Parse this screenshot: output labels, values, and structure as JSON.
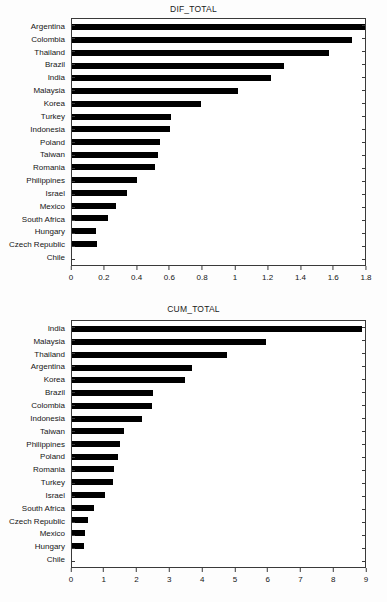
{
  "chart_data": [
    {
      "type": "bar",
      "orientation": "horizontal",
      "title": "DIF_TOTAL",
      "xlabel": "",
      "ylabel": "",
      "xlim": [
        0,
        1.8
      ],
      "grid": false,
      "legend": "none",
      "xticks": [
        "0",
        "0.2",
        "0.4",
        "0.6",
        "0.8",
        "1",
        "1.2",
        "1.4",
        "1.6",
        "1.8"
      ],
      "xtick_values": [
        0,
        0.2,
        0.4,
        0.6,
        0.8,
        1.0,
        1.2,
        1.4,
        1.6,
        1.8
      ],
      "categories": [
        "Argentina",
        "Colombia",
        "Thailand",
        "Brazil",
        "India",
        "Malaysia",
        "Korea",
        "Turkey",
        "Indonesia",
        "Poland",
        "Taiwan",
        "Romania",
        "Philippines",
        "Israel",
        "Mexico",
        "South Africa",
        "Hungary",
        "Czech Republic",
        "Chile"
      ],
      "values": [
        1.8,
        1.72,
        1.58,
        1.3,
        1.22,
        1.02,
        0.79,
        0.61,
        0.6,
        0.54,
        0.53,
        0.51,
        0.4,
        0.34,
        0.27,
        0.22,
        0.15,
        0.155,
        0.0
      ]
    },
    {
      "type": "bar",
      "orientation": "horizontal",
      "title": "CUM_TOTAL",
      "xlabel": "",
      "ylabel": "",
      "xlim": [
        0,
        9
      ],
      "grid": false,
      "legend": "none",
      "xticks": [
        "0",
        "1",
        "2",
        "3",
        "4",
        "5",
        "6",
        "7",
        "8",
        "9"
      ],
      "xtick_values": [
        0,
        1,
        2,
        3,
        4,
        5,
        6,
        7,
        8,
        9
      ],
      "categories": [
        "India",
        "Malaysia",
        "Thailand",
        "Argentina",
        "Korea",
        "Brazil",
        "Colombia",
        "Indonesia",
        "Taiwan",
        "Philippines",
        "Poland",
        "Romania",
        "Turkey",
        "Israel",
        "South Africa",
        "Czech Republic",
        "Mexico",
        "Hungary",
        "Chile"
      ],
      "values": [
        8.9,
        5.95,
        4.75,
        3.7,
        3.48,
        2.5,
        2.45,
        2.15,
        1.6,
        1.47,
        1.42,
        1.28,
        1.27,
        1.02,
        0.68,
        0.5,
        0.4,
        0.37,
        0.0
      ]
    }
  ],
  "colors": {
    "bar": "#000000",
    "axis": "#3a3a3a",
    "background": "#fdfdfd",
    "text": "#151515"
  }
}
